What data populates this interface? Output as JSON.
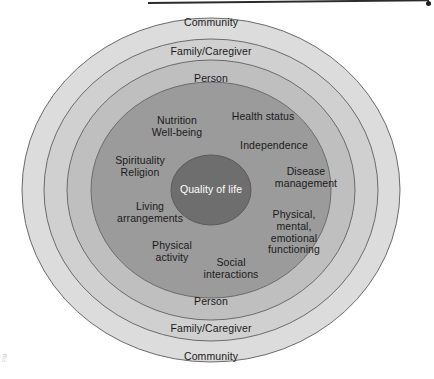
{
  "diagram": {
    "type": "concentric-ellipse-model",
    "center": {
      "cx": 211,
      "cy": 190
    },
    "core": {
      "name": "quality-of-life-core",
      "label": "Quality of life",
      "fill": "#6e6e6e",
      "text_color": "#ffffff",
      "rx": 40,
      "ry": 35
    },
    "rings": [
      {
        "name": "community-ring",
        "label": "Community",
        "fill": "#dcdcdc",
        "stroke": "#6b6b6b",
        "rx": 189,
        "ry": 172,
        "top_label_y": 23,
        "bottom_label_y": 357
      },
      {
        "name": "family-caregiver-ring",
        "label": "Family/Caregiver",
        "fill": "#d0d0d0",
        "stroke": "#6b6b6b",
        "rx": 167,
        "ry": 151,
        "top_label_y": 52,
        "bottom_label_y": 329
      },
      {
        "name": "person-ring",
        "label": "Person",
        "fill": "#bfbfbf",
        "stroke": "#6b6b6b",
        "rx": 144,
        "ry": 130,
        "top_label_y": 79,
        "bottom_label_y": 302
      },
      {
        "name": "domains-ring",
        "label": "",
        "fill": "#9b9b9b",
        "stroke": "#6b6b6b",
        "rx": 120,
        "ry": 108,
        "top_label_y": 0,
        "bottom_label_y": 0
      }
    ],
    "domains": [
      {
        "name": "domain-nutrition-wellbeing",
        "text": "Nutrition\nWell-being",
        "x": 177,
        "y": 127
      },
      {
        "name": "domain-health-status",
        "text": "Health status",
        "x": 263,
        "y": 117
      },
      {
        "name": "domain-independence",
        "text": "Independence",
        "x": 274,
        "y": 146
      },
      {
        "name": "domain-spirituality-religion",
        "text": "Spirituality\nReligion",
        "x": 140,
        "y": 167
      },
      {
        "name": "domain-disease-management",
        "text": "Disease\nmanagement",
        "x": 306,
        "y": 178
      },
      {
        "name": "domain-living-arrangements",
        "text": "Living\narrangements",
        "x": 150,
        "y": 213
      },
      {
        "name": "domain-physical-mental-emotional",
        "text": "Physical,\nmental,\nemotional\nfunctioning",
        "x": 294,
        "y": 232
      },
      {
        "name": "domain-physical-activity",
        "text": "Physical\nactivity",
        "x": 172,
        "y": 252
      },
      {
        "name": "domain-social-interactions",
        "text": "Social\ninteractions",
        "x": 231,
        "y": 269
      }
    ],
    "artifacts": {
      "edge_caption": "Fig."
    }
  }
}
